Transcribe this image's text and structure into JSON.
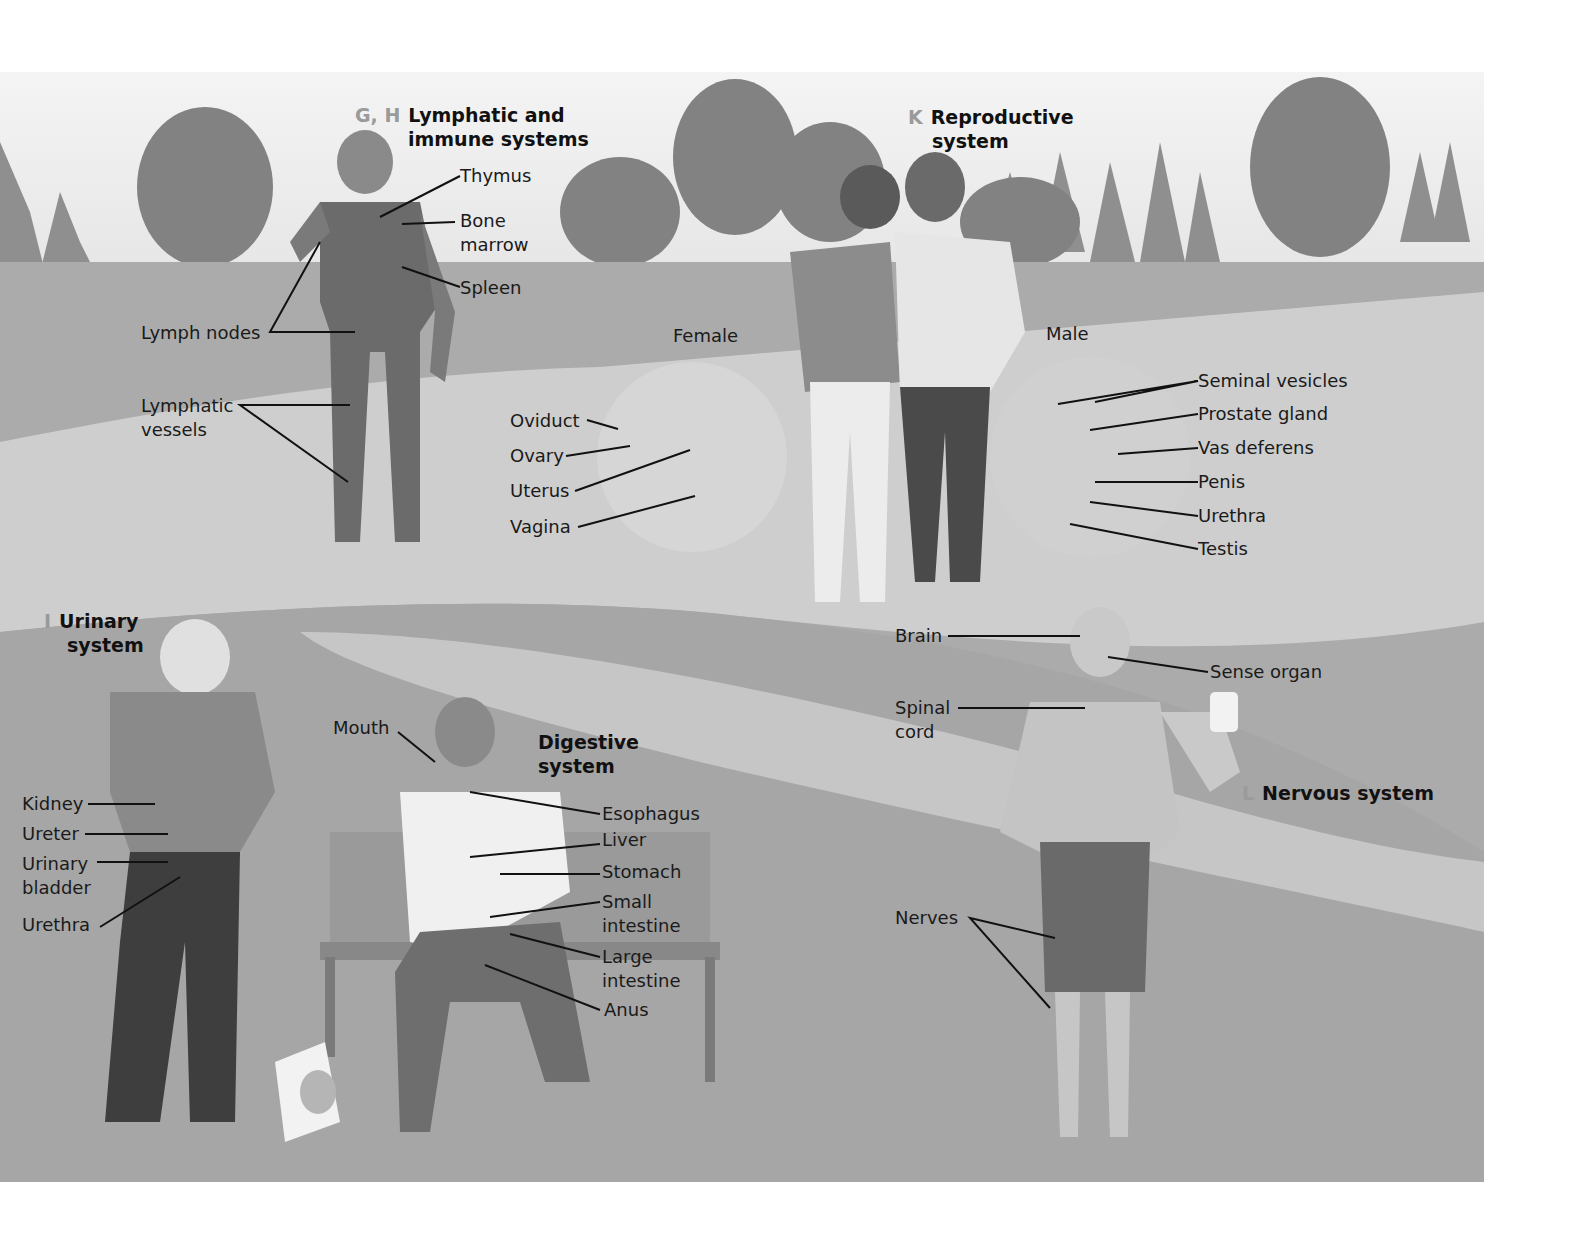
{
  "figure": {
    "background_colors": {
      "sky": "#ececec",
      "grass": "#a9a9a9",
      "path": "#cfcfcf",
      "trees": "#7e7e7e"
    }
  },
  "systems": {
    "lymphatic": {
      "code": "G, H",
      "title_line1": "Lymphatic and",
      "title_line2": "immune systems",
      "labels": [
        "Thymus",
        "Bone",
        "marrow",
        "Spleen",
        "Lymph nodes",
        "Lymphatic",
        "vessels"
      ]
    },
    "reproductive": {
      "code": "K",
      "title_line1": "Reproductive",
      "title_line2": "system",
      "female": {
        "heading": "Female",
        "labels": [
          "Oviduct",
          "Ovary",
          "Uterus",
          "Vagina"
        ]
      },
      "male": {
        "heading": "Male",
        "labels": [
          "Seminal vesicles",
          "Prostate gland",
          "Vas deferens",
          "Penis",
          "Urethra",
          "Testis"
        ]
      }
    },
    "urinary": {
      "code": "I",
      "title_line1": "Urinary",
      "title_line2": "system",
      "labels": [
        "Kidney",
        "Ureter",
        "Urinary",
        "bladder",
        "Urethra"
      ]
    },
    "digestive": {
      "title_line1": "Digestive",
      "title_line2": "system",
      "labels": [
        "Mouth",
        "Esophagus",
        "Liver",
        "Stomach",
        "Small",
        "intestine",
        "Large",
        "intestine",
        "Anus"
      ]
    },
    "nervous": {
      "code": "L",
      "title": "Nervous system",
      "labels": [
        "Brain",
        "Sense organ",
        "Spinal",
        "cord",
        "Nerves"
      ]
    }
  }
}
